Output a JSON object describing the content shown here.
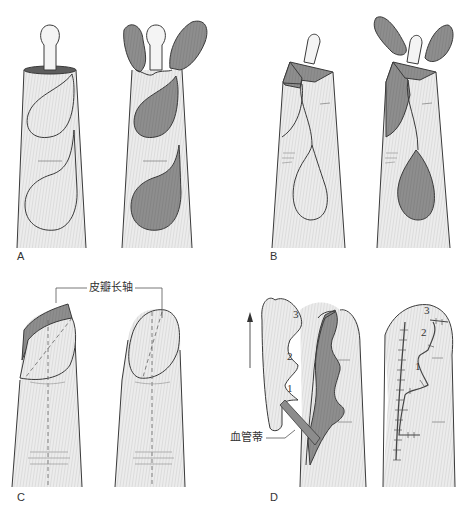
{
  "figure": {
    "type": "surgical-illustration",
    "colors": {
      "skin_fill": "#e9e9e9",
      "hatch": "#cfcfcf",
      "outline": "#3a3a3a",
      "flap_gray": "#8c8c8c",
      "bone_fill": "#f4f4f4"
    },
    "panels": [
      {
        "id": "A",
        "label": "A"
      },
      {
        "id": "B",
        "label": "B"
      },
      {
        "id": "C",
        "label": "C"
      },
      {
        "id": "D",
        "label": "D"
      }
    ],
    "annotations": {
      "flap_long_axis": "皮瓣长轴",
      "vascular_pedicle": "血管蒂",
      "flap_numbers": [
        "1",
        "2",
        "3"
      ],
      "sutured_numbers": [
        "1",
        "2",
        "3"
      ],
      "arrow": "up-arrow"
    }
  }
}
